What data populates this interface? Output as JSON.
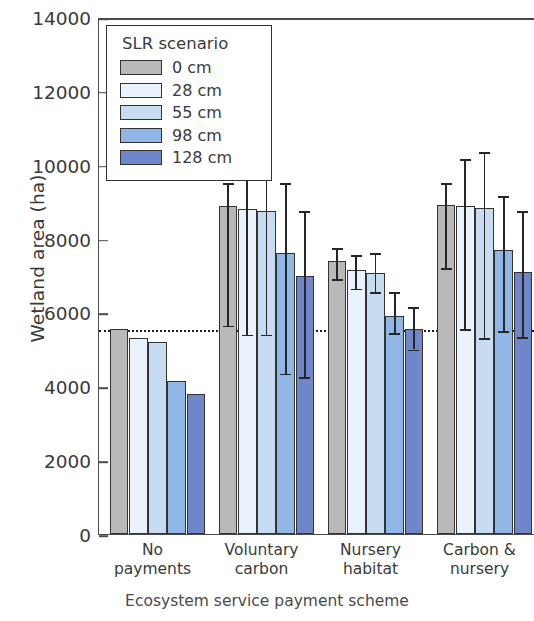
{
  "chart_data": {
    "type": "bar",
    "title": "",
    "xlabel": "Ecosystem service payment scheme",
    "ylabel": "Wetland area (ha)",
    "ylim": [
      0,
      14000
    ],
    "yticks": [
      0,
      2000,
      4000,
      6000,
      8000,
      10000,
      12000,
      14000
    ],
    "ytick_labels": [
      "0",
      "2000",
      "4000",
      "6000",
      "8000",
      "10000",
      "12000",
      "14000"
    ],
    "grid": false,
    "legend_position": "upper left",
    "legend_title": "SLR scenario",
    "categories": [
      "No payments",
      "Voluntary carbon",
      "Nursery habitat",
      "Carbon & nursery"
    ],
    "category_lines": [
      [
        "No",
        "payments"
      ],
      [
        "Voluntary",
        "carbon"
      ],
      [
        "Nursery",
        "habitat"
      ],
      [
        "Carbon &",
        "nursery"
      ]
    ],
    "reference_line": {
      "value": 5550,
      "style": "dotted"
    },
    "series": [
      {
        "name": "0 cm",
        "color": "#b9b9b9",
        "values": [
          5550,
          8880,
          7400,
          8920
        ],
        "err_low": [
          null,
          5700,
          6950,
          7250
        ],
        "err_high": [
          null,
          9550,
          7800,
          9550
        ]
      },
      {
        "name": "28 cm",
        "color": "#eaf3fb",
        "values": [
          5300,
          8800,
          7150,
          8880
        ],
        "err_low": [
          null,
          5450,
          6700,
          5600
        ],
        "err_high": [
          null,
          10200,
          7600,
          10200
        ]
      },
      {
        "name": "55 cm",
        "color": "#c7dcf1",
        "values": [
          5200,
          8750,
          7060,
          8840
        ],
        "err_low": [
          null,
          5450,
          6600,
          5350
        ],
        "err_high": [
          null,
          10250,
          7650,
          10400
        ]
      },
      {
        "name": "98 cm",
        "color": "#8fb6e4",
        "values": [
          4150,
          7600,
          5900,
          7680
        ],
        "err_low": [
          null,
          4400,
          5500,
          5550
        ],
        "err_high": [
          null,
          9550,
          6600,
          9200
        ]
      },
      {
        "name": "128 cm",
        "color": "#6f86c9",
        "values": [
          3800,
          7000,
          5550,
          7100
        ],
        "err_low": [
          null,
          4300,
          5050,
          5380
        ],
        "err_high": [
          null,
          8800,
          6200,
          8800
        ]
      }
    ]
  }
}
